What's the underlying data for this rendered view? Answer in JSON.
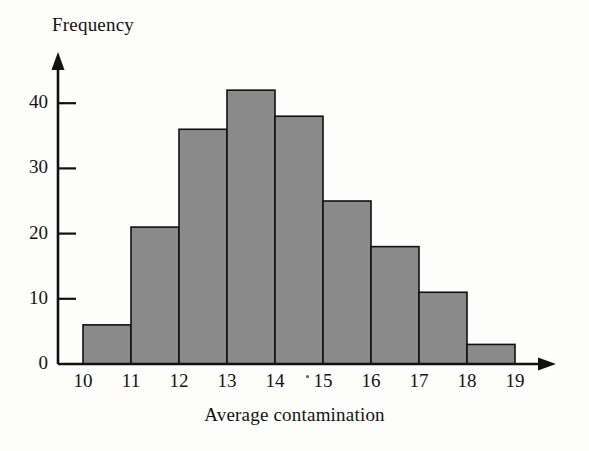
{
  "figure": {
    "background_color": "#fdfdfb",
    "bar_fill_color": "#8a8a8a",
    "bar_stroke_color": "#111111",
    "axis_color": "#111111"
  },
  "chart_data": {
    "type": "bar",
    "title": "",
    "subtitle": "",
    "xlabel": "Average contamination",
    "ylabel": "Frequency",
    "categories": [
      "10-11",
      "11-12",
      "12-13",
      "13-14",
      "14-15",
      "15-16",
      "16-17",
      "17-18",
      "18-19"
    ],
    "bin_edges": [
      10,
      11,
      12,
      13,
      14,
      15,
      16,
      17,
      18,
      19
    ],
    "values": [
      6,
      21,
      36,
      42,
      38,
      25,
      18,
      11,
      3
    ],
    "bin_width": 1,
    "xlim": [
      10,
      19
    ],
    "ylim": [
      0,
      45
    ],
    "xticks": [
      10,
      11,
      12,
      13,
      14,
      15,
      16,
      17,
      18,
      19
    ],
    "yticks": [
      0,
      10,
      20,
      30,
      40
    ],
    "xtick_labels": [
      "10",
      "11",
      "12",
      "13",
      "14",
      "15",
      "16",
      "17",
      "18",
      "19"
    ],
    "ytick_labels": [
      "0",
      "10",
      "20",
      "30",
      "40"
    ],
    "grid": false,
    "legend": null,
    "legend_position": "none",
    "annotations": [],
    "total_count": 200
  }
}
